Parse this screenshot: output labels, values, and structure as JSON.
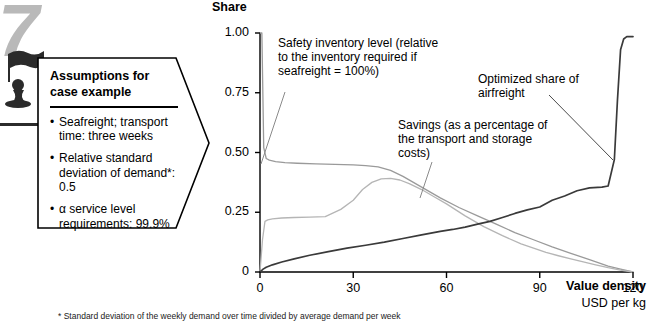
{
  "badge": {
    "number": "7",
    "icon": "chess-pawn-flag-icon"
  },
  "assumptions": {
    "title_line1": "Assumptions for",
    "title_line2": "case example",
    "items": [
      "Seafreight; transport time: three weeks",
      "Relative standard deviation of demand*: 0.5",
      "α service level requirements: 99.9%"
    ],
    "bullet": "•"
  },
  "annotations": {
    "safety": "Safety inventory level (relative to the inventory required if seafreight = 100%)",
    "savings": "Savings (as a percentage of the transport and storage costs)",
    "airfreight": "Optimized share of airfreight"
  },
  "footnote": "* Standard deviation of the weekly demand over time divided by average demand per week",
  "colors": {
    "airfreight": "#3a3a3a",
    "safety": "#9a9a9a",
    "savings": "#b5b5b5",
    "axis": "#000000",
    "badge": "#b9b9b9"
  },
  "chart_data": {
    "type": "line",
    "title": "Share",
    "xlabel": "Value density",
    "xunit": "USD per kg",
    "ylabel": "Share",
    "xlim": [
      0,
      120
    ],
    "ylim": [
      0,
      1.0
    ],
    "grid": false,
    "legend": "annotations-with-leader-lines",
    "xticks": [
      0,
      30,
      60,
      90,
      120
    ],
    "xtick_labels": [
      "0",
      "30",
      "60",
      "90",
      "120"
    ],
    "yticks": [
      0,
      0.25,
      0.5,
      0.75,
      1.0
    ],
    "ytick_labels": [
      "0",
      "0.25",
      "0.50",
      "0.75",
      "1.00"
    ],
    "series": [
      {
        "name": "Safety inventory level",
        "color": "#9a9a9a",
        "x": [
          0,
          0.6,
          1.2,
          2,
          3,
          5,
          8,
          12,
          18,
          24,
          30,
          34,
          38,
          42,
          46,
          52,
          58,
          64,
          70,
          76,
          82,
          88,
          94,
          100,
          106,
          112,
          116,
          120
        ],
        "y": [
          1.0,
          1.0,
          0.52,
          0.475,
          0.468,
          0.462,
          0.458,
          0.455,
          0.452,
          0.45,
          0.448,
          0.445,
          0.44,
          0.425,
          0.4,
          0.355,
          0.31,
          0.27,
          0.235,
          0.2,
          0.165,
          0.135,
          0.105,
          0.078,
          0.052,
          0.025,
          0.012,
          0.0
        ]
      },
      {
        "name": "Savings",
        "color": "#b5b5b5",
        "x": [
          0,
          0.8,
          1.6,
          2.5,
          4,
          7,
          11,
          16,
          21,
          26,
          30,
          33,
          36,
          39,
          42,
          45,
          48,
          52,
          56,
          60,
          66,
          72,
          78,
          84,
          88,
          92,
          96,
          100,
          104,
          108,
          112,
          116,
          120
        ],
        "y": [
          0.0,
          0.135,
          0.212,
          0.218,
          0.222,
          0.226,
          0.228,
          0.23,
          0.232,
          0.262,
          0.3,
          0.345,
          0.375,
          0.39,
          0.392,
          0.385,
          0.37,
          0.345,
          0.315,
          0.285,
          0.235,
          0.19,
          0.152,
          0.118,
          0.1,
          0.082,
          0.068,
          0.055,
          0.042,
          0.03,
          0.018,
          0.008,
          0.0
        ]
      },
      {
        "name": "Optimized share of airfreight",
        "color": "#3a3a3a",
        "x": [
          0,
          1,
          2,
          4,
          7,
          11,
          16,
          22,
          28,
          34,
          40,
          46,
          52,
          58,
          62,
          66,
          70,
          74,
          78,
          82,
          86,
          90,
          94,
          98,
          102,
          106,
          110,
          112,
          114,
          115,
          116,
          117,
          118,
          120
        ],
        "y": [
          0.0,
          0.012,
          0.02,
          0.03,
          0.042,
          0.055,
          0.07,
          0.085,
          0.1,
          0.112,
          0.125,
          0.14,
          0.155,
          0.17,
          0.178,
          0.188,
          0.2,
          0.212,
          0.228,
          0.245,
          0.26,
          0.272,
          0.3,
          0.318,
          0.34,
          0.352,
          0.355,
          0.36,
          0.47,
          0.72,
          0.93,
          0.975,
          0.985,
          0.985
        ]
      }
    ]
  }
}
